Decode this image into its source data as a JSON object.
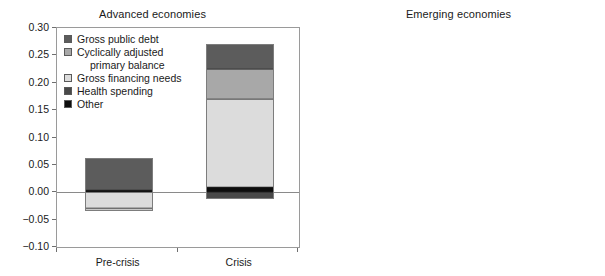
{
  "figure": {
    "panels": [
      "Advanced economies",
      "Emerging economies"
    ]
  },
  "chart_data": [
    {
      "type": "bar",
      "subtype": "stacked-diverging",
      "title": "Advanced economies",
      "xlabel": "",
      "ylabel": "",
      "categories": [
        "Pre-crisis",
        "Crisis"
      ],
      "ylim": [
        -0.1,
        0.3
      ],
      "yticks": [
        0.3,
        0.25,
        0.2,
        0.15,
        0.1,
        0.05,
        0.0,
        -0.05,
        -0.1
      ],
      "ytick_labels": [
        "0.30",
        "0.25",
        "0.20",
        "0.15",
        "0.10",
        "0.05",
        "0.00",
        "-0.05",
        "-0.10"
      ],
      "grid": false,
      "legend_position": "upper-left",
      "series": [
        {
          "name": "Gross public debt",
          "color": "#5c5c5c",
          "values": [
            0.058,
            0.045
          ]
        },
        {
          "name": "Cyclically adjusted primary balance",
          "color": "#a8a8a8",
          "values": [
            -0.029,
            0.056
          ]
        },
        {
          "name": "Gross financing needs",
          "color": "#dcdcdc",
          "values": [
            -0.006,
            0.161
          ]
        },
        {
          "name": "Health spending",
          "color": "#494949",
          "values": [
            0.0,
            -0.013
          ]
        },
        {
          "name": "Other",
          "color": "#0d0d0d",
          "values": [
            0.004,
            0.009
          ]
        }
      ],
      "bars": [
        {
          "category": "Pre-crisis",
          "positive_total": 0.062,
          "negative_total": -0.035,
          "positive_stack": [
            {
              "name": "Other",
              "color": "#0d0d0d",
              "value": 0.004
            },
            {
              "name": "Gross public debt",
              "color": "#5c5c5c",
              "value": 0.058
            }
          ],
          "negative_stack": [
            {
              "name": "Gross financing needs",
              "color": "#dcdcdc",
              "value": -0.029
            },
            {
              "name": "Cyclically adjusted primary balance",
              "color": "#c9c9c9",
              "value": -0.006
            }
          ]
        },
        {
          "category": "Crisis",
          "positive_total": 0.271,
          "negative_total": -0.013,
          "positive_stack": [
            {
              "name": "Other",
              "color": "#0d0d0d",
              "value": 0.009
            },
            {
              "name": "Gross financing needs",
              "color": "#dcdcdc",
              "value": 0.161
            },
            {
              "name": "Cyclically adjusted primary balance",
              "color": "#a8a8a8",
              "value": 0.056
            },
            {
              "name": "Gross public debt",
              "color": "#5c5c5c",
              "value": 0.045
            }
          ],
          "negative_stack": [
            {
              "name": "Health spending",
              "color": "#494949",
              "value": -0.013
            }
          ]
        }
      ],
      "legend": [
        {
          "label": "Gross public debt",
          "color": "#5c5c5c"
        },
        {
          "label": "Cyclically adjusted",
          "label_cont": "primary balance",
          "color": "#a8a8a8"
        },
        {
          "label": "Gross financing needs",
          "color": "#dcdcdc"
        },
        {
          "label": "Health spending",
          "color": "#494949"
        },
        {
          "label": "Other",
          "color": "#0d0d0d"
        }
      ]
    },
    {
      "type": "bar",
      "subtype": "stacked-diverging",
      "title": "Emerging economies",
      "xlabel": "",
      "ylabel": "",
      "categories": [
        "Pre-crisis",
        "Crisis"
      ],
      "ylim": [
        -0.15,
        0.3
      ],
      "yticks": [
        0.3,
        0.25,
        0.2,
        0.15,
        0.1,
        0.05,
        0.0,
        -0.05,
        -0.1,
        -0.15
      ],
      "ytick_labels": [
        "0.30",
        "0.25",
        "0.20",
        "0.15",
        "0.10",
        "0.05",
        "0.00",
        "-0.05",
        "-0.10",
        "-0.15"
      ],
      "grid": false,
      "legend_position": "upper-left",
      "series": [
        {
          "name": "Short-term external debt to reserves",
          "color": "#757575",
          "values": [
            0.006,
            0.002
          ]
        },
        {
          "name": "Cyclically adjusted primary balance",
          "color": "#c2c2c2",
          "values": [
            0.018,
            0.029
          ]
        },
        {
          "name": "Short-term debt",
          "color": "#555555",
          "values": [
            -0.032,
            -0.012
          ]
        },
        {
          "name": "Foreign currency debt",
          "color": "#e0e0e0",
          "values": [
            0.019,
            0.0
          ]
        },
        {
          "name": "Other",
          "color": "#0d0d0d",
          "values": [
            0.019,
            -0.001
          ]
        }
      ],
      "bars": [
        {
          "category": "Pre-crisis",
          "positive_total": 0.061,
          "negative_total": -0.085,
          "positive_stack": [
            {
              "name": "Other",
              "color": "#0d0d0d",
              "value": 0.019
            },
            {
              "name": "Foreign currency debt",
              "color": "#e0e0e0",
              "value": 0.019
            },
            {
              "name": "Cyclically adjusted primary balance",
              "color": "#c2c2c2",
              "value": 0.017
            },
            {
              "name": "Short-term external debt to reserves",
              "color": "#8f8f8f",
              "value": 0.006
            }
          ],
          "negative_stack": [
            {
              "name": "Short-term debt",
              "color": "#555555",
              "value": -0.032
            },
            {
              "name": "Short-term external debt to reserves",
              "color": "#757575",
              "value": -0.053
            }
          ]
        },
        {
          "category": "Crisis",
          "positive_total": 0.031,
          "negative_total": -0.013,
          "positive_stack": [
            {
              "name": "Cyclically adjusted primary balance",
              "color": "#c2c2c2",
              "value": 0.029
            },
            {
              "name": "Short-term external debt to reserves",
              "color": "#8f8f8f",
              "value": 0.002
            }
          ],
          "negative_stack": [
            {
              "name": "Other",
              "color": "#111111",
              "value": -0.013
            }
          ]
        }
      ],
      "legend": [
        {
          "label": "Short-term external debt to reserves",
          "color": "#757575"
        },
        {
          "label": "Cyclically adjusted primary balance",
          "color": "#c2c2c2"
        },
        {
          "label": "Short-term debt",
          "color": "#555555"
        },
        {
          "label": "Foreign currency debt",
          "color": "#e0e0e0"
        },
        {
          "label": "Other",
          "color": "#0d0d0d"
        }
      ]
    }
  ]
}
